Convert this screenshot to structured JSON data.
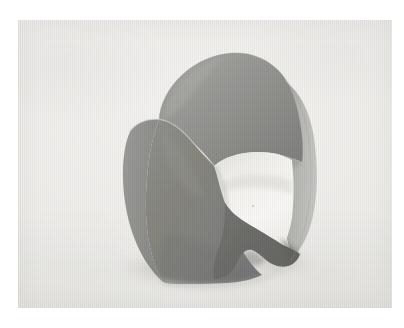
{
  "page": {
    "background_color": "#ffffff",
    "width": 404,
    "height": 328
  },
  "photograph": {
    "caption": "",
    "frame": {
      "left": 18,
      "top": 20,
      "width": 374,
      "height": 288
    },
    "medium": "halftone photographic reproduction",
    "background_color": "#f1f0ee",
    "texture": "fine vertical scan striping"
  },
  "subject": {
    "name": "curved-sheet-sculpture",
    "description": "A doubly-curved saddle-form sheet standing on a pale textured surface, its upper lobe folding over to reveal a bright interior opening.",
    "parts": [
      {
        "name": "top-lobe",
        "label": "upper folded lobe",
        "color": "#9b9b98"
      },
      {
        "name": "front-panel",
        "label": "main front face",
        "color": "#878784"
      },
      {
        "name": "left-flank",
        "label": "left flank",
        "color": "#919190"
      },
      {
        "name": "interior-opening",
        "label": "bright interior opening",
        "color": "#f3f2ef"
      },
      {
        "name": "lower-right-panel",
        "label": "lower right shaded panel",
        "color": "#6f6f6c"
      },
      {
        "name": "right-edge-strip",
        "label": "right trailing edge",
        "color": "#b5b5b2"
      },
      {
        "name": "cast-shadow",
        "label": "contact shadow",
        "color": "#d9d8d4"
      }
    ],
    "palette": {
      "lightest": "#f3f2ef",
      "light_gray": "#b5b5b2",
      "mid_gray": "#878784",
      "dark_gray": "#6f6f6c",
      "background": "#f1f0ee"
    }
  }
}
